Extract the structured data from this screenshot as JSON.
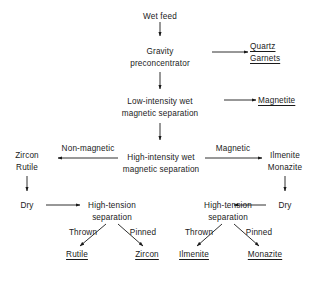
{
  "diagram": {
    "line_color": "#1a1a1a",
    "background": "#ffffff",
    "nodes": {
      "wet_feed": "Wet feed",
      "gravity_l1": "Gravity",
      "gravity_l2": "preconcentrator",
      "quartz": "Quartz",
      "garnets": "Garnets",
      "lims_l1": "Low-intensity wet",
      "lims_l2": "magnetic separation",
      "magnetite": "Magnetite",
      "wims_l1": "High-intensity wet",
      "wims_l2": "magnetic separation",
      "zircon_mid": "Zircon",
      "rutile_mid": "Rutile",
      "ilmenite_mid": "Ilmenite",
      "monazite_mid": "Monazite",
      "dry_left": "Dry",
      "dry_right": "Dry",
      "hts_left_l1": "High-tension",
      "hts_left_l2": "separation",
      "hts_right_l1": "High-tension",
      "hts_right_l2": "separation",
      "rutile_product": "Rutile",
      "zircon_product": "Zircon",
      "ilmenite_product": "Ilmenite",
      "monazite_product": "Monazite"
    },
    "edge_labels": {
      "non_magnetic": "Non-magnetic",
      "magnetic": "Magnetic",
      "thrown_left": "Thrown",
      "pinned_left": "Pinned",
      "thrown_right": "Thrown",
      "pinned_right": "Pinned"
    }
  }
}
